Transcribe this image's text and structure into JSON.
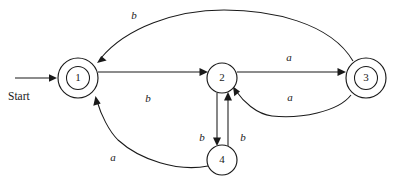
{
  "diagram": {
    "type": "finite-state-machine",
    "title": "",
    "start_label": "Start",
    "states": [
      {
        "id": "1",
        "label": "1",
        "cx": 78,
        "cy": 78,
        "r": 20,
        "accepting": true
      },
      {
        "id": "2",
        "label": "2",
        "cx": 222,
        "cy": 78,
        "r": 15,
        "accepting": false
      },
      {
        "id": "3",
        "label": "3",
        "cx": 366,
        "cy": 78,
        "r": 20,
        "accepting": true
      },
      {
        "id": "4",
        "label": "4",
        "cx": 222,
        "cy": 160,
        "r": 15,
        "accepting": false
      }
    ],
    "transitions": [
      {
        "id": "t1",
        "from": "1",
        "to": "2",
        "label": "b",
        "label_x": 148,
        "label_y": 99
      },
      {
        "id": "t2",
        "from": "2",
        "to": "3",
        "label": "a",
        "label_x": 289,
        "label_y": 58
      },
      {
        "id": "t3",
        "from": "3",
        "to": "1",
        "label": "b",
        "label_x": 134,
        "label_y": 16
      },
      {
        "id": "t4",
        "from": "3",
        "to": "2",
        "label": "a",
        "label_x": 290,
        "label_y": 98
      },
      {
        "id": "t5",
        "from": "2",
        "to": "4",
        "label": "b",
        "label_x": 202,
        "label_y": 138
      },
      {
        "id": "t6",
        "from": "4",
        "to": "2",
        "label": "b",
        "label_x": 243,
        "label_y": 138
      },
      {
        "id": "t7",
        "from": "4",
        "to": "1",
        "label": "a",
        "label_x": 113,
        "label_y": 158
      }
    ],
    "start_arrow": {
      "x1": 15,
      "y1": 78,
      "x2": 57,
      "y2": 78,
      "text_x": 8,
      "text_y": 97
    },
    "colors": {
      "stroke": "#1a1a1a",
      "background": "#ffffff",
      "text": "#1a1a1a"
    }
  }
}
